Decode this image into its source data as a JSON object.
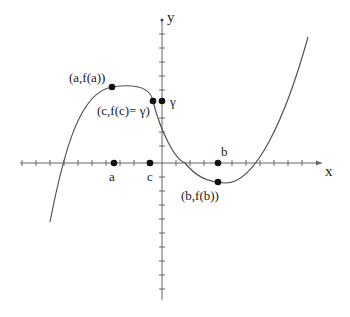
{
  "figure": {
    "axes": {
      "x_label": "x",
      "y_label": "y",
      "origin_px": [
        162,
        163
      ],
      "x_range_px": [
        20,
        322
      ],
      "y_range_px": [
        14,
        300
      ],
      "tick_spacing_px": 14
    },
    "curve": {
      "type": "cubic",
      "path": "M50,222 C64,150 80,92 112,87 C132,84 150,86 153,101 C160,130 175,160 185,163 C195,175 205,182 225,183 C255,184 285,120 308,37"
    },
    "points": [
      {
        "id": "a_on_axis",
        "x": 114,
        "y": 163,
        "label": "a"
      },
      {
        "id": "c_on_axis",
        "x": 150,
        "y": 163,
        "label": "c"
      },
      {
        "id": "b_on_axis",
        "x": 218,
        "y": 163,
        "label": "b"
      },
      {
        "id": "a_point",
        "x": 112,
        "y": 87,
        "label": "(a,f(a))"
      },
      {
        "id": "c_point",
        "x": 153,
        "y": 101,
        "label": "(c,f(c)= γ)"
      },
      {
        "id": "gamma_point",
        "x": 162,
        "y": 101,
        "label": "γ"
      },
      {
        "id": "b_point",
        "x": 218,
        "y": 182,
        "label": "(b,f(b))"
      }
    ],
    "labels": {
      "a_point": "(a,f(a))",
      "c_point": "(c,f(c)= γ)",
      "gamma": "γ",
      "b_point": "(b,f(b))",
      "a": "a",
      "c": "c",
      "b": "b",
      "x": "x",
      "y": "y"
    },
    "colors": {
      "line": "#555555",
      "dot": "#111111",
      "text": "#222222"
    }
  }
}
